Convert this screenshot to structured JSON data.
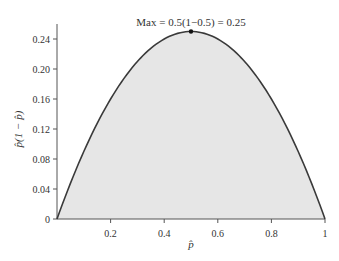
{
  "chart_data": {
    "type": "area",
    "title": "",
    "function": "p(1-p)",
    "xlabel": "p̂",
    "ylabel": "p̂(1 − p̂)",
    "xlim": [
      0,
      1
    ],
    "ylim": [
      0,
      0.26
    ],
    "x_ticks": [
      0.2,
      0.4,
      0.6,
      0.8,
      1
    ],
    "x_tick_labels": [
      "0.2",
      "0.4",
      "0.6",
      "0.8",
      "1"
    ],
    "y_ticks": [
      0,
      0.04,
      0.08,
      0.12,
      0.16,
      0.2,
      0.24
    ],
    "y_tick_labels": [
      "0",
      "0.04",
      "0.08",
      "0.12",
      "0.16",
      "0.20",
      "0.24"
    ],
    "grid": false,
    "legend": null,
    "x": [
      0,
      0.1,
      0.2,
      0.3,
      0.4,
      0.5,
      0.6,
      0.7,
      0.8,
      0.9,
      1.0
    ],
    "values": [
      0,
      0.09,
      0.16,
      0.21,
      0.24,
      0.25,
      0.24,
      0.21,
      0.16,
      0.09,
      0
    ],
    "annotations": [
      {
        "text": "Max = 0.5(1−0.5) = 0.25",
        "x": 0.5,
        "y": 0.25,
        "marker": "dot"
      }
    ],
    "colors": {
      "curve": "#3a3a3a",
      "fill": "#e6e6e6",
      "axis": "#555555"
    }
  }
}
